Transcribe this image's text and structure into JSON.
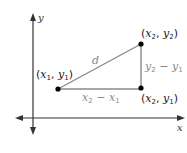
{
  "diagram": {
    "type": "distance-formula-right-triangle",
    "axes": {
      "x_label": "x",
      "y_label": "y"
    },
    "points": [
      {
        "id": "p1",
        "label_var1": "x",
        "label_sub1": "1",
        "label_var2": "y",
        "label_sub2": "1"
      },
      {
        "id": "p2",
        "label_var1": "x",
        "label_sub1": "2",
        "label_var2": "y",
        "label_sub2": "2"
      },
      {
        "id": "p3",
        "label_var1": "x",
        "label_sub1": "2",
        "label_var2": "y",
        "label_sub2": "1"
      }
    ],
    "segments": {
      "hypotenuse_label": "d",
      "horizontal": {
        "a": "x",
        "a_sub": "2",
        "op": "−",
        "b": "x",
        "b_sub": "1"
      },
      "vertical": {
        "a": "y",
        "a_sub": "2",
        "op": "−",
        "b": "y",
        "b_sub": "1"
      }
    },
    "colors": {
      "axis": "#333333",
      "triangle": "#8a8a8a",
      "point": "#000000",
      "coord_text": "#1a1a1a",
      "segment_text": "#8a8a8a"
    }
  }
}
